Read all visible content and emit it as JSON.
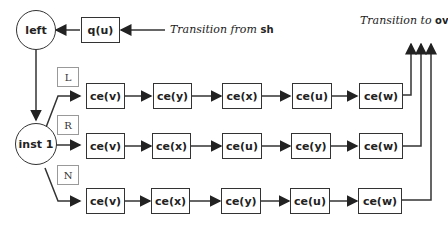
{
  "nodes": {
    "left": "left",
    "q": "q(u)",
    "inst": "inst 1"
  },
  "annotations": {
    "from_prefix": "Transition from",
    "from_target": "sh",
    "to_prefix": "Transition to",
    "to_target": "ov"
  },
  "branches": [
    {
      "label": "L",
      "steps": [
        "ce(v)",
        "ce(y)",
        "ce(x)",
        "ce(u)",
        "ce(w)"
      ]
    },
    {
      "label": "R",
      "steps": [
        "ce(v)",
        "ce(x)",
        "ce(u)",
        "ce(y)",
        "ce(w)"
      ]
    },
    {
      "label": "N",
      "steps": [
        "ce(v)",
        "ce(x)",
        "ce(y)",
        "ce(u)",
        "ce(w)"
      ]
    }
  ]
}
